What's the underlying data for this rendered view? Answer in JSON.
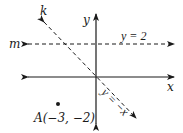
{
  "diagram": {
    "type": "coordinate-plane",
    "axes": {
      "x_label": "x",
      "y_label": "y"
    },
    "lines": [
      {
        "name": "m",
        "label": "m",
        "equation_label": "y = 2",
        "style": "dashed",
        "direction": "horizontal"
      },
      {
        "name": "k",
        "label": "k",
        "equation_label": "y = −x",
        "style": "dashed",
        "direction": "diagonal"
      }
    ],
    "points": [
      {
        "name": "A",
        "label": "A(−3, −2)",
        "x": -3,
        "y": -2
      }
    ],
    "colors": {
      "stroke": "#1a1a1a",
      "background": "#ffffff"
    }
  }
}
